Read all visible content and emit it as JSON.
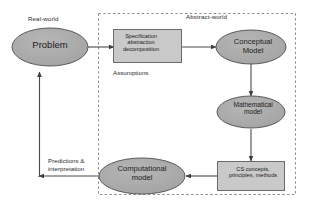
{
  "diagram": {
    "regions": [
      {
        "id": "real-world",
        "label": "Real-world",
        "border": "none"
      },
      {
        "id": "abstract-world",
        "label": "Abstract-world",
        "border": "dashed"
      }
    ],
    "nodes": [
      {
        "id": "problem",
        "shape": "ellipse",
        "label": "Problem",
        "fill": "#a9a9a9",
        "stroke": "#5a5a5a"
      },
      {
        "id": "specification",
        "shape": "rectangle",
        "label": "Specification\nabstraction\ndecomposition",
        "fill": "#c9c9c9",
        "stroke": "#6b6b6b"
      },
      {
        "id": "conceptual-model",
        "shape": "ellipse",
        "label": "Conceptual\nModel",
        "fill": "#a9a9a9",
        "stroke": "#5a5a5a"
      },
      {
        "id": "mathematical-model",
        "shape": "ellipse",
        "label": "Mathematical\nmodel",
        "fill": "#a9a9a9",
        "stroke": "#5a5a5a"
      },
      {
        "id": "cs-concepts",
        "shape": "rectangle",
        "label": "CS concepts,\nprinciples, methods",
        "fill": "#c9c9c9",
        "stroke": "#6b6b6b"
      },
      {
        "id": "computational-model",
        "shape": "ellipse",
        "label": "Computational\nmodel",
        "fill": "#a9a9a9",
        "stroke": "#5a5a5a"
      }
    ],
    "edges": [
      {
        "id": "problem-to-specification",
        "from": "problem",
        "to": "specification",
        "label": ""
      },
      {
        "id": "specification-to-conceptual",
        "from": "specification",
        "to": "conceptual-model",
        "label": ""
      },
      {
        "id": "conceptual-to-mathematical",
        "from": "conceptual-model",
        "to": "mathematical-model",
        "label": ""
      },
      {
        "id": "mathematical-to-cs-concepts",
        "from": "mathematical-model",
        "to": "cs-concepts",
        "label": ""
      },
      {
        "id": "cs-concepts-to-computational",
        "from": "cs-concepts",
        "to": "computational-model",
        "label": ""
      },
      {
        "id": "computational-to-problem",
        "from": "computational-model",
        "to": "problem",
        "label": "Predictions &\ninterpretation"
      }
    ],
    "annotations": [
      {
        "id": "assumptions",
        "label": "Assumptions",
        "near": "specification"
      }
    ],
    "colors": {
      "ellipse_fill": "#a9a9a9",
      "box_fill": "#c9c9c9",
      "shape_stroke": "#5a5a5a",
      "edge_stroke": "#4a4a4a",
      "region_dash": "#8a8a8a",
      "background": "#ffffff",
      "text": "#1a1a1a"
    }
  }
}
